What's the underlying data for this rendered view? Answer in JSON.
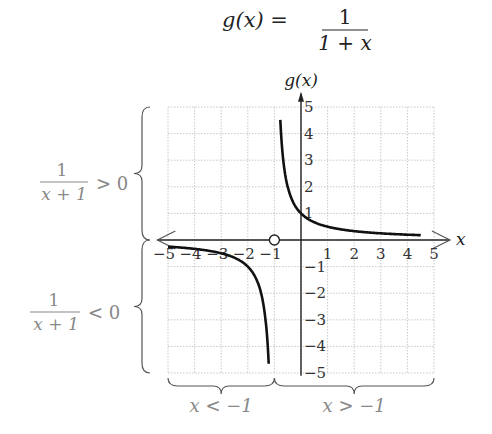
{
  "title": {
    "lhs": "g(x) =",
    "num": "1",
    "den": "1 + x"
  },
  "chart_data": {
    "type": "line",
    "xlabel": "x",
    "ylabel": "g(x)",
    "xlim": [
      -5,
      5
    ],
    "ylim": [
      -5,
      5
    ],
    "grid": true,
    "x_ticks": [
      "-5",
      "-4",
      "-3",
      "-2",
      "-1",
      "1",
      "2",
      "3",
      "4",
      "5"
    ],
    "y_ticks": [
      "5",
      "4",
      "3",
      "2",
      "1",
      "-1",
      "-2",
      "-3",
      "-4",
      "-5"
    ],
    "vertical_asymptote": -1,
    "horizontal_asymptote": 0,
    "open_circle": {
      "x": -1,
      "y": 0
    },
    "series": [
      {
        "name": "g(x) for x > -1",
        "x": [
          -0.8,
          -0.5,
          0,
          1,
          2,
          3,
          4,
          5
        ],
        "y": [
          5,
          2,
          1,
          0.5,
          0.333,
          0.25,
          0.2,
          0.167
        ]
      },
      {
        "name": "g(x) for x < -1",
        "x": [
          -5,
          -4,
          -3,
          -2,
          -1.5,
          -1.2
        ],
        "y": [
          -0.25,
          -0.333,
          -0.5,
          -1,
          -2,
          -5
        ]
      }
    ],
    "annotations": [
      {
        "text": "1/(x+1) > 0",
        "region": "y > 0"
      },
      {
        "text": "1/(x+1) < 0",
        "region": "y < 0"
      },
      {
        "text": "x < -1",
        "region": "left of x = -1"
      },
      {
        "text": "x > -1",
        "region": "right of x = -1"
      }
    ]
  },
  "labels": {
    "y_axis": "g(x)",
    "x_axis": "x",
    "pos_num": "1",
    "pos_den": "x + 1",
    "pos_rel": "> 0",
    "neg_num": "1",
    "neg_den": "x + 1",
    "neg_rel": "< 0",
    "left_region": "x < −1",
    "right_region": "x > −1"
  }
}
